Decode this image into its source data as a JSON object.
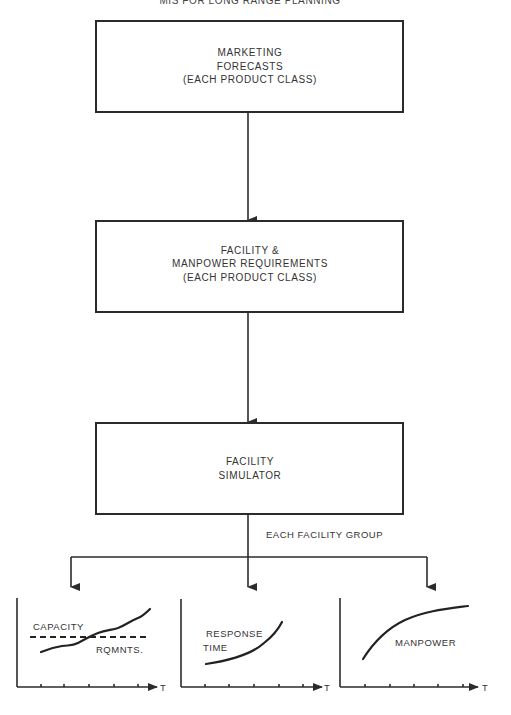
{
  "title": "MIS FOR LONG RANGE PLANNING",
  "boxes": [
    {
      "lines": [
        "MARKETING",
        "FORECASTS",
        "(EACH PRODUCT CLASS)"
      ]
    },
    {
      "lines": [
        "FACILITY &",
        "MANPOWER REQUIREMENTS",
        "(EACH PRODUCT CLASS)"
      ]
    },
    {
      "lines": [
        "FACILITY",
        "SIMULATOR"
      ]
    }
  ],
  "branch_label": "EACH FACILITY GROUP",
  "graphs": [
    {
      "name": "capacity-vs-requirements",
      "axis_label": "T",
      "labels": [
        "CAPACITY",
        "RQMNTS."
      ],
      "tick_count": 5,
      "description": "Dashed constant capacity line crossed by rising requirements curve"
    },
    {
      "name": "response-time",
      "axis_label": "T",
      "labels": [
        "RESPONSE",
        "TIME"
      ],
      "tick_count": 5,
      "description": "Exponentially rising response time curve"
    },
    {
      "name": "manpower",
      "axis_label": "T",
      "labels": [
        "MANPOWER"
      ],
      "tick_count": 5,
      "description": "Concave rising manpower curve leveling off"
    }
  ]
}
